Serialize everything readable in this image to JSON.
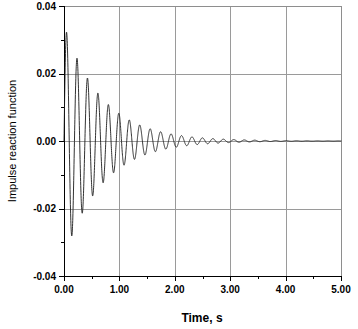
{
  "figure": {
    "background_color": "#ffffff",
    "plot_area": {
      "left": 64,
      "top": 6,
      "right": 341,
      "bottom": 276
    }
  },
  "chart_data": {
    "type": "line",
    "title": "",
    "subtitle": "",
    "xlabel": "Time, s",
    "ylabel": "Impulse reaction function",
    "xlim": [
      0,
      5
    ],
    "ylim": [
      -0.04,
      0.04
    ],
    "x_ticks": [
      0,
      1,
      2,
      3,
      4,
      5
    ],
    "x_tick_labels": [
      "0.00",
      "1.00",
      "2.00",
      "3.00",
      "4.00",
      "5.00"
    ],
    "x_minor_ticks": [
      0.5,
      1.5,
      2.5,
      3.5,
      4.5
    ],
    "y_ticks": [
      -0.04,
      -0.02,
      0,
      0.02,
      0.04
    ],
    "y_tick_labels": [
      "-0.04",
      "-0.02",
      "0.00",
      "0.02",
      "0.04"
    ],
    "y_minor_ticks": [
      -0.03,
      -0.01,
      0.01,
      0.03
    ],
    "grid": {
      "vertical": true,
      "horizontal": true,
      "color": "#9a9a9a"
    },
    "legend": {
      "visible": false,
      "position": "none"
    },
    "annotations": [],
    "series": [
      {
        "name": "Impulse reaction function",
        "color": "#1b1b1b",
        "line_width": 0.9,
        "marker": "none",
        "model": "damped_sinusoid",
        "model_params": {
          "amplitude": 0.0345,
          "damping_rate": 1.45,
          "frequency_hz": 5.3,
          "phase_rad": 0.0,
          "t_start": 0.0,
          "t_end": 5.0,
          "sample_count": 2600
        },
        "description": "Exponentially damped oscillation starting near zero, first positive peak about 0.030 near t=0.06 s, first negative trough about -0.0255 near t=0.15 s, decaying to nearly zero by t=3.0 s",
        "key_extrema": [
          {
            "t": 0.06,
            "y": 0.03
          },
          {
            "t": 0.15,
            "y": -0.0255
          },
          {
            "t": 0.25,
            "y": 0.022
          },
          {
            "t": 0.34,
            "y": -0.019
          },
          {
            "t": 0.44,
            "y": 0.016
          },
          {
            "t": 0.53,
            "y": -0.014
          },
          {
            "t": 0.63,
            "y": 0.012
          },
          {
            "t": 0.72,
            "y": -0.0103
          },
          {
            "t": 0.82,
            "y": 0.0088
          },
          {
            "t": 0.91,
            "y": -0.0076
          },
          {
            "t": 1.01,
            "y": 0.0064
          },
          {
            "t": 1.1,
            "y": -0.0055
          },
          {
            "t": 1.2,
            "y": 0.0047
          },
          {
            "t": 1.39,
            "y": 0.0034
          },
          {
            "t": 1.58,
            "y": 0.0025
          },
          {
            "t": 1.77,
            "y": 0.0018
          },
          {
            "t": 1.96,
            "y": 0.0013
          },
          {
            "t": 2.34,
            "y": 0.0007
          },
          {
            "t": 2.72,
            "y": 0.0003
          },
          {
            "t": 3.1,
            "y": 0.0002
          },
          {
            "t": 4.0,
            "y": 0.0
          },
          {
            "t": 5.0,
            "y": 0.0
          }
        ]
      }
    ]
  }
}
